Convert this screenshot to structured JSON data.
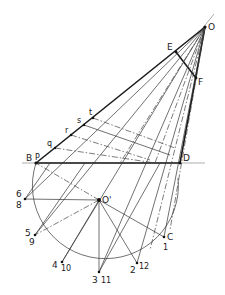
{
  "diagram": {
    "type": "geometric-construction",
    "points": {
      "O": {
        "label": "O",
        "x": 205,
        "y": 27
      },
      "E": {
        "label": "E",
        "x": 176,
        "y": 52
      },
      "F": {
        "label": "F",
        "x": 196,
        "y": 78
      },
      "B": {
        "label": "B",
        "x": 36,
        "y": 163
      },
      "P": {
        "label": "P",
        "x": 36,
        "y": 163
      },
      "D": {
        "label": "D",
        "x": 180,
        "y": 163
      },
      "q": {
        "label": "q",
        "x": 55,
        "y": 148
      },
      "r": {
        "label": "r",
        "x": 71,
        "y": 135
      },
      "s": {
        "label": "s",
        "x": 84,
        "y": 125
      },
      "t": {
        "label": "t",
        "x": 93,
        "y": 118
      },
      "Oprime": {
        "label": "O'",
        "x": 99,
        "y": 200
      },
      "C": {
        "label": "C",
        "x": 164,
        "y": 237
      }
    },
    "circle": {
      "center": "O'",
      "cx": 99,
      "cy": 200,
      "r": 73
    },
    "circle_points": [
      {
        "labels": "6 / 8",
        "top": "6",
        "bottom": "8",
        "x": 25,
        "y": 199
      },
      {
        "labels": "5 / 9",
        "top": "5",
        "bottom": "9",
        "x": 35,
        "y": 235
      },
      {
        "labels": "4 / 10",
        "top": "4",
        "bottom": "10",
        "x": 62,
        "y": 262
      },
      {
        "labels": "3 / 11",
        "top": "3",
        "bottom": "11",
        "x": 99,
        "y": 272
      },
      {
        "labels": "2 / 12",
        "top": "2",
        "bottom": "12",
        "x": 137,
        "y": 263
      },
      {
        "labels": "C / 1",
        "top": "C",
        "bottom": "1",
        "x": 164,
        "y": 237
      }
    ],
    "labels": {
      "O": "O",
      "E": "E",
      "F": "F",
      "B": "B",
      "P": "P",
      "D": "D",
      "q": "q",
      "r": "r",
      "s": "s",
      "t": "t",
      "Oprime": "O'",
      "C": "C",
      "n1": "1",
      "n2": "2",
      "n3": "3",
      "n4": "4",
      "n5": "5",
      "n6": "6",
      "n8": "8",
      "n9": "9",
      "n10": "10",
      "n11": "11",
      "n12": "12"
    }
  }
}
